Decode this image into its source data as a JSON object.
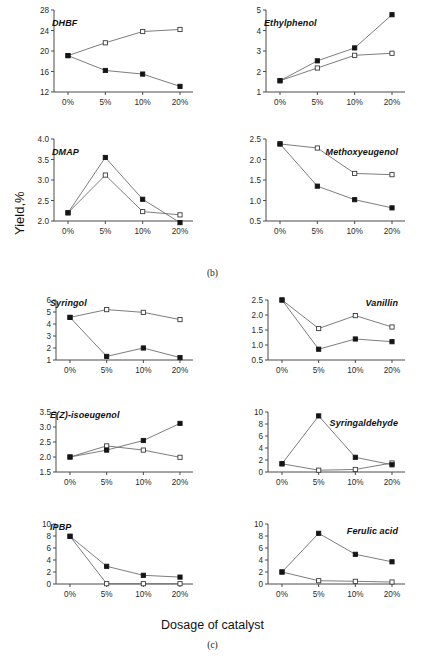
{
  "figure": {
    "y_axis_title": "Yield,%",
    "x_axis_title": "Dosage of catalyst",
    "caption_b": "(b)",
    "caption_c": "(c)"
  },
  "chart_data": [
    {
      "type": "line",
      "title": "DHBF",
      "group": "b",
      "xlabel": "Dosage of catalyst",
      "ylabel": "Yield,%",
      "categories": [
        "0%",
        "5%",
        "10%",
        "20%"
      ],
      "ylim": [
        12,
        28
      ],
      "yticks": [
        12,
        16,
        20,
        24,
        28
      ],
      "ytick_labels": [
        "12",
        "16",
        "20",
        "24",
        "28"
      ],
      "grid": false,
      "legend": "none",
      "series": [
        {
          "name": "open-square",
          "marker": "open",
          "values": [
            19.1,
            21.6,
            23.8,
            24.2
          ]
        },
        {
          "name": "filled-square",
          "marker": "filled",
          "values": [
            19.1,
            16.2,
            15.5,
            13.1
          ]
        }
      ]
    },
    {
      "type": "line",
      "title": "Ethylphenol",
      "group": "b",
      "xlabel": "Dosage of catalyst",
      "ylabel": "Yield,%",
      "categories": [
        "0%",
        "5%",
        "10%",
        "20%"
      ],
      "ylim": [
        1,
        5
      ],
      "yticks": [
        1,
        2,
        3,
        4,
        5
      ],
      "ytick_labels": [
        "1",
        "2",
        "3",
        "4",
        "5"
      ],
      "grid": false,
      "legend": "none",
      "series": [
        {
          "name": "open-square",
          "marker": "open",
          "values": [
            1.55,
            2.17,
            2.79,
            2.89
          ]
        },
        {
          "name": "filled-square",
          "marker": "filled",
          "values": [
            1.55,
            2.52,
            3.15,
            4.77
          ]
        }
      ]
    },
    {
      "type": "line",
      "title": "DMAP",
      "group": "b",
      "xlabel": "Dosage of catalyst",
      "ylabel": "Yield,%",
      "categories": [
        "0%",
        "5%",
        "10%",
        "20%"
      ],
      "ylim": [
        2.0,
        4.0
      ],
      "yticks": [
        2.0,
        2.5,
        3.0,
        3.5,
        4.0
      ],
      "ytick_labels": [
        "2.0",
        "2.5",
        "3.0",
        "3.5",
        "4.0"
      ],
      "grid": false,
      "legend": "none",
      "series": [
        {
          "name": "open-square",
          "marker": "open",
          "values": [
            2.2,
            3.12,
            2.23,
            2.15
          ]
        },
        {
          "name": "filled-square",
          "marker": "filled",
          "values": [
            2.2,
            3.55,
            2.53,
            1.96
          ]
        }
      ]
    },
    {
      "type": "line",
      "title": "Methoxyeugenol",
      "group": "b",
      "xlabel": "Dosage of catalyst",
      "ylabel": "Yield,%",
      "categories": [
        "0%",
        "5%",
        "10%",
        "20%"
      ],
      "ylim": [
        0.5,
        2.5
      ],
      "yticks": [
        0.5,
        1.0,
        1.5,
        2.0,
        2.5
      ],
      "ytick_labels": [
        "0.5",
        "1.0",
        "1.5",
        "2.0",
        "2.5"
      ],
      "grid": false,
      "legend": "none",
      "series": [
        {
          "name": "open-square",
          "marker": "open",
          "values": [
            2.38,
            2.28,
            1.66,
            1.63
          ]
        },
        {
          "name": "filled-square",
          "marker": "filled",
          "values": [
            2.38,
            1.35,
            1.02,
            0.82
          ]
        }
      ]
    },
    {
      "type": "line",
      "title": "Syringol",
      "group": "c",
      "xlabel": "Dosage of catalyst",
      "ylabel": "Yield,%",
      "categories": [
        "0%",
        "5%",
        "10%",
        "20%"
      ],
      "ylim": [
        1,
        6
      ],
      "yticks": [
        1,
        2,
        3,
        4,
        5,
        6
      ],
      "ytick_labels": [
        "1",
        "2",
        "3",
        "4",
        "5",
        "6"
      ],
      "grid": false,
      "legend": "none",
      "series": [
        {
          "name": "open-square",
          "marker": "open",
          "values": [
            4.55,
            5.2,
            4.97,
            4.37
          ]
        },
        {
          "name": "filled-square",
          "marker": "filled",
          "values": [
            4.55,
            1.3,
            2.0,
            1.2
          ]
        }
      ]
    },
    {
      "type": "line",
      "title": "Vanillin",
      "group": "c",
      "xlabel": "Dosage of catalyst",
      "ylabel": "Yield,%",
      "categories": [
        "0%",
        "5%",
        "10%",
        "20%"
      ],
      "ylim": [
        0.5,
        2.5
      ],
      "yticks": [
        0.5,
        1.0,
        1.5,
        2.0,
        2.5
      ],
      "ytick_labels": [
        "0.5",
        "1.0",
        "1.5",
        "2.0",
        "2.5"
      ],
      "grid": false,
      "legend": "none",
      "series": [
        {
          "name": "open-square",
          "marker": "open",
          "values": [
            2.5,
            1.55,
            1.98,
            1.6
          ]
        },
        {
          "name": "filled-square",
          "marker": "filled",
          "values": [
            2.5,
            0.86,
            1.2,
            1.11
          ]
        }
      ]
    },
    {
      "type": "line",
      "title": "E(Z)-isoeugenol",
      "group": "c",
      "xlabel": "Dosage of catalyst",
      "ylabel": "Yield,%",
      "categories": [
        "0%",
        "5%",
        "10%",
        "20%"
      ],
      "ylim": [
        1.5,
        3.5
      ],
      "yticks": [
        1.5,
        2.0,
        2.5,
        3.0,
        3.5
      ],
      "ytick_labels": [
        "1.5",
        "2.0",
        "2.5",
        "3.0",
        "3.5"
      ],
      "grid": false,
      "legend": "none",
      "series": [
        {
          "name": "open-square",
          "marker": "open",
          "values": [
            2.0,
            2.37,
            2.23,
            1.99
          ]
        },
        {
          "name": "filled-square",
          "marker": "filled",
          "values": [
            2.0,
            2.23,
            2.55,
            3.12
          ]
        }
      ]
    },
    {
      "type": "line",
      "title": "Syringaldehyde",
      "group": "c",
      "xlabel": "Dosage of catalyst",
      "ylabel": "Yield,%",
      "categories": [
        "0%",
        "5%",
        "10%",
        "20%"
      ],
      "ylim": [
        0,
        10
      ],
      "yticks": [
        0,
        2,
        4,
        6,
        8,
        10
      ],
      "ytick_labels": [
        "0",
        "2",
        "4",
        "6",
        "8",
        "10"
      ],
      "grid": false,
      "legend": "none",
      "series": [
        {
          "name": "open-square",
          "marker": "open",
          "values": [
            1.37,
            0.3,
            0.42,
            1.5
          ]
        },
        {
          "name": "filled-square",
          "marker": "filled",
          "values": [
            1.37,
            9.35,
            2.45,
            1.2
          ]
        }
      ]
    },
    {
      "type": "line",
      "title": "IPBP",
      "group": "c",
      "xlabel": "Dosage of catalyst",
      "ylabel": "Yield,%",
      "categories": [
        "0%",
        "5%",
        "10%",
        "20%"
      ],
      "ylim": [
        0,
        10
      ],
      "yticks": [
        0,
        2,
        4,
        6,
        8,
        10
      ],
      "ytick_labels": [
        "0",
        "2",
        "4",
        "6",
        "8",
        "10"
      ],
      "grid": false,
      "legend": "none",
      "series": [
        {
          "name": "open-square",
          "marker": "open",
          "values": [
            7.95,
            0.05,
            0.05,
            0.05
          ]
        },
        {
          "name": "filled-square",
          "marker": "filled",
          "values": [
            7.95,
            2.95,
            1.45,
            1.15
          ]
        }
      ]
    },
    {
      "type": "line",
      "title": "Ferulic acid",
      "group": "c",
      "xlabel": "Dosage of catalyst",
      "ylabel": "Yield,%",
      "categories": [
        "0%",
        "5%",
        "10%",
        "20%"
      ],
      "ylim": [
        0,
        10
      ],
      "yticks": [
        0,
        2,
        4,
        6,
        8,
        10
      ],
      "ytick_labels": [
        "0",
        "2",
        "4",
        "6",
        "8",
        "10"
      ],
      "grid": false,
      "legend": "none",
      "series": [
        {
          "name": "open-square",
          "marker": "open",
          "values": [
            2.0,
            0.55,
            0.45,
            0.33
          ]
        },
        {
          "name": "filled-square",
          "marker": "filled",
          "values": [
            2.0,
            8.45,
            4.95,
            3.7
          ]
        }
      ]
    }
  ],
  "panel_layout": [
    {
      "index": 0,
      "left": 28,
      "top": 6,
      "w": 166,
      "h": 100,
      "title_x": 52,
      "title_y": 18,
      "title_align": "left"
    },
    {
      "index": 1,
      "left": 240,
      "top": 6,
      "w": 166,
      "h": 100,
      "title_x": 264,
      "title_y": 18,
      "title_align": "left"
    },
    {
      "index": 2,
      "left": 28,
      "top": 135,
      "w": 166,
      "h": 100,
      "title_x": 52,
      "title_y": 147,
      "title_align": "left"
    },
    {
      "index": 3,
      "left": 240,
      "top": 135,
      "w": 166,
      "h": 100,
      "title_x": 398,
      "title_y": 147,
      "title_align": "right"
    },
    {
      "index": 4,
      "left": 30,
      "top": 8,
      "w": 164,
      "h": 78,
      "title_x": 50,
      "title_y": 10,
      "title_align": "left"
    },
    {
      "index": 5,
      "left": 242,
      "top": 8,
      "w": 164,
      "h": 78,
      "title_x": 398,
      "title_y": 10,
      "title_align": "right"
    },
    {
      "index": 6,
      "left": 30,
      "top": 120,
      "w": 164,
      "h": 78,
      "title_x": 50,
      "title_y": 122,
      "title_align": "left"
    },
    {
      "index": 7,
      "left": 242,
      "top": 120,
      "w": 164,
      "h": 78,
      "title_x": 398,
      "title_y": 130,
      "title_align": "right"
    },
    {
      "index": 8,
      "left": 30,
      "top": 232,
      "w": 164,
      "h": 78,
      "title_x": 50,
      "title_y": 234,
      "title_align": "left"
    },
    {
      "index": 9,
      "left": 242,
      "top": 232,
      "w": 164,
      "h": 78,
      "title_x": 398,
      "title_y": 238,
      "title_align": "right"
    }
  ]
}
